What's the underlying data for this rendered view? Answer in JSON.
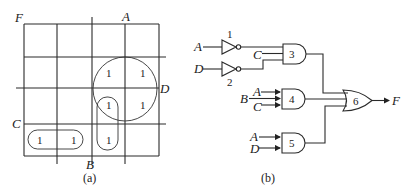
{
  "kmap": {
    "caption": "(a)",
    "function_label": "F",
    "var_labels": {
      "A": "A",
      "B": "B",
      "C": "C",
      "D": "D"
    },
    "cells": [
      {
        "row": 1,
        "col": 2,
        "value": "1"
      },
      {
        "row": 1,
        "col": 3,
        "value": "1"
      },
      {
        "row": 2,
        "col": 2,
        "value": "1"
      },
      {
        "row": 2,
        "col": 3,
        "value": "1"
      },
      {
        "row": 3,
        "col": 0,
        "value": "1"
      },
      {
        "row": 3,
        "col": 1,
        "value": "1"
      },
      {
        "row": 3,
        "col": 2,
        "value": "1"
      }
    ],
    "groups": [
      {
        "name": "circle-AD",
        "shape": "circle",
        "cells": [
          "r1c2",
          "r1c3",
          "r2c2",
          "r2c3"
        ]
      },
      {
        "name": "pill-vertical",
        "shape": "pill",
        "cells": [
          "r2c2",
          "r3c2"
        ]
      },
      {
        "name": "pill-horizontal",
        "shape": "pill",
        "cells": [
          "r3c0",
          "r3c1"
        ]
      }
    ]
  },
  "circuit": {
    "caption": "(b)",
    "output_label": "F",
    "inverters": [
      {
        "id": "1",
        "input": "A"
      },
      {
        "id": "2",
        "input": "D"
      }
    ],
    "gates": [
      {
        "id": "3",
        "type": "AND",
        "inputs": [
          "NOT A",
          "C",
          "NOT D"
        ]
      },
      {
        "id": "4",
        "type": "AND",
        "inputs": [
          "A",
          "B",
          "C"
        ]
      },
      {
        "id": "5",
        "type": "AND",
        "inputs": [
          "A",
          "D"
        ]
      },
      {
        "id": "6",
        "type": "OR",
        "inputs": [
          "3",
          "4",
          "5"
        ]
      }
    ],
    "labels": {
      "inv1_in": "A",
      "inv2_in": "D",
      "g3_c": "C",
      "g4_a": "A",
      "g4_b": "B",
      "g4_c": "C",
      "g5_a": "A",
      "g5_d": "D",
      "inv1_id": "1",
      "inv2_id": "2",
      "g3_id": "3",
      "g4_id": "4",
      "g5_id": "5",
      "g6_id": "6"
    }
  }
}
